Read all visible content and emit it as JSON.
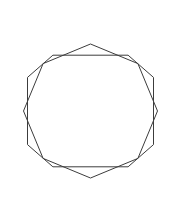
{
  "figure": {
    "background_color": "#ffffff",
    "stroke_color": "#3c3c3c",
    "stroke_width": 1,
    "canvas": {
      "width": 181,
      "height": 199
    },
    "center": {
      "x": 90.5,
      "y": 111
    },
    "circumradius": 67,
    "shapes": [
      {
        "name": "octagon-axis-aligned",
        "sides": 8,
        "rotation_degrees": 22.5,
        "points": "52.9,55.2 128.1,55.2 153.5,77.4 153.5,144.6 128.1,166.8 52.9,166.8 27.5,144.6 27.5,77.4"
      },
      {
        "name": "octagon-rotated",
        "sides": 8,
        "rotation_degrees": 0,
        "points": "90.5,44.0 137.9,63.6 157.5,111.0 137.9,158.4 90.5,178.0 43.1,158.4 23.5,111.0 43.1,63.6"
      }
    ]
  }
}
